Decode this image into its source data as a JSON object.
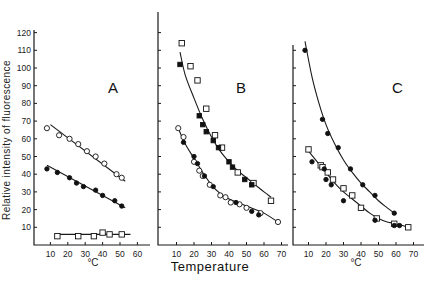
{
  "figure": {
    "y_axis_label": "Relative intensity of fluorescence",
    "x_axis_title": "Temperature",
    "unit_label": "°C",
    "colors": {
      "ink": "#1a1a1a",
      "background": "#ffffff"
    }
  },
  "chart_data": [
    {
      "type": "scatter",
      "panel": "A",
      "title": "A",
      "xlabel": "°C",
      "ylabel": "Relative intensity of fluorescence",
      "xlim": [
        0,
        70
      ],
      "ylim": [
        0,
        120
      ],
      "x_ticks": [
        10,
        20,
        30,
        40,
        50,
        60
      ],
      "y_ticks": [
        10,
        20,
        30,
        40,
        50,
        60,
        70,
        80,
        90,
        100,
        110,
        120
      ],
      "series": [
        {
          "name": "open circles",
          "marker": "circle-open",
          "x": [
            8,
            15,
            21,
            26,
            31,
            36,
            41,
            48,
            51
          ],
          "y": [
            66,
            62,
            60,
            57,
            53,
            50,
            46,
            40,
            38
          ],
          "fit": {
            "kind": "line",
            "x": [
              10,
              53
            ],
            "y": [
              68,
              36
            ]
          }
        },
        {
          "name": "filled circles",
          "marker": "circle-filled",
          "x": [
            8,
            14,
            21,
            25,
            29,
            36,
            40,
            47,
            51
          ],
          "y": [
            43,
            41,
            38,
            35,
            33,
            31,
            28,
            25,
            22
          ],
          "fit": {
            "kind": "line",
            "x": [
              8,
              53
            ],
            "y": [
              45,
              21
            ]
          }
        },
        {
          "name": "open squares",
          "marker": "square-open",
          "x": [
            14,
            26,
            35,
            40,
            44,
            51
          ],
          "y": [
            5,
            5,
            5,
            7,
            6,
            6
          ],
          "fit": {
            "kind": "line",
            "x": [
              14,
              56
            ],
            "y": [
              6,
              6
            ]
          }
        }
      ]
    },
    {
      "type": "scatter",
      "panel": "B",
      "title": "B",
      "xlabel": "Temperature",
      "ylabel": "",
      "xlim": [
        0,
        75
      ],
      "ylim": [
        0,
        120
      ],
      "x_ticks": [
        10,
        20,
        30,
        40,
        50,
        60,
        70
      ],
      "series": [
        {
          "name": "open squares (upper)",
          "marker": "square-open",
          "x": [
            13,
            18,
            22,
            27,
            32,
            36,
            45,
            54,
            64
          ],
          "y": [
            114,
            101,
            93,
            77,
            62,
            55,
            41,
            35,
            25
          ],
          "fit": {
            "kind": "curve",
            "x": [
              12,
              15,
              20,
              25,
              30,
              35,
              40,
              45,
              50,
              55,
              60,
              64
            ],
            "y": [
              109,
              96,
              83,
              71,
              61,
              53,
              47,
              42,
              38,
              34,
              30,
              27
            ]
          }
        },
        {
          "name": "filled squares (upper)",
          "marker": "square-filled",
          "x": [
            12,
            23,
            25,
            27,
            31,
            34,
            40,
            42,
            49,
            53
          ],
          "y": [
            102,
            73,
            68,
            64,
            59,
            55,
            47,
            44,
            37,
            34
          ],
          "fit": null
        },
        {
          "name": "open circles (lower)",
          "marker": "circle-open",
          "x": [
            11,
            14,
            20,
            23,
            25,
            29,
            35,
            38,
            41,
            46,
            50,
            58,
            68
          ],
          "y": [
            66,
            61,
            47,
            42,
            39,
            34,
            28,
            27,
            24,
            23,
            21,
            18,
            13
          ],
          "fit": {
            "kind": "curve",
            "x": [
              11,
              15,
              20,
              25,
              30,
              35,
              40,
              45,
              50,
              55,
              60,
              68
            ],
            "y": [
              66,
              57,
              49,
              41,
              34,
              29,
              26,
              24,
              22,
              20,
              18,
              13
            ]
          }
        },
        {
          "name": "filled circles (lower)",
          "marker": "circle-filled",
          "x": [
            14,
            20,
            22,
            26,
            31,
            44,
            53,
            57
          ],
          "y": [
            58,
            50,
            46,
            39,
            33,
            24,
            19,
            17
          ],
          "fit": null
        }
      ]
    },
    {
      "type": "scatter",
      "panel": "C",
      "title": "C",
      "xlabel": "°C",
      "ylabel": "",
      "xlim": [
        0,
        75
      ],
      "ylim": [
        0,
        120
      ],
      "x_ticks": [
        10,
        20,
        30,
        40,
        50,
        60,
        70
      ],
      "series": [
        {
          "name": "filled circles (upper)",
          "marker": "circle-filled",
          "x": [
            8,
            18,
            21,
            27,
            34,
            41,
            48,
            59
          ],
          "y": [
            110,
            71,
            63,
            55,
            43,
            34,
            28,
            18
          ],
          "fit": {
            "kind": "curve",
            "x": [
              8,
              12,
              16,
              20,
              25,
              30,
              35,
              40,
              45,
              50,
              55,
              59
            ],
            "y": [
              115,
              95,
              80,
              68,
              57,
              48,
              41,
              35,
              30,
              25,
              21,
              18
            ]
          }
        },
        {
          "name": "open squares (lower)",
          "marker": "square-open",
          "x": [
            10,
            17,
            18,
            21,
            24,
            30,
            35,
            40,
            49,
            59,
            67
          ],
          "y": [
            54,
            45,
            44,
            41,
            37,
            32,
            28,
            21,
            15,
            12,
            10
          ],
          "fit": {
            "kind": "curve",
            "x": [
              10,
              15,
              20,
              25,
              30,
              35,
              40,
              45,
              50,
              55,
              60,
              67
            ],
            "y": [
              53,
              47,
              41,
              35,
              30,
              26,
              22,
              18,
              15,
              13,
              12,
              10
            ]
          }
        },
        {
          "name": "filled circles (lower)",
          "marker": "circle-filled",
          "x": [
            12,
            19,
            20,
            23,
            30,
            48,
            59,
            62
          ],
          "y": [
            47,
            43,
            37,
            34,
            25,
            14,
            11,
            11
          ],
          "fit": null
        }
      ]
    }
  ]
}
